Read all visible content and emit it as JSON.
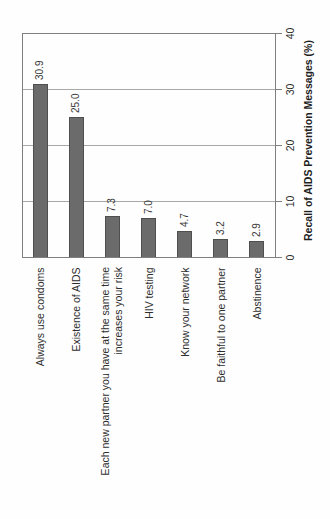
{
  "chart_data": {
    "type": "bar",
    "orientation": "rotated-90-counterclockwise",
    "title": "",
    "axis_label": "Recall of AIDS Prevention Messages (%)",
    "categories": [
      [
        "Always use condoms"
      ],
      [
        "Existence of AIDS"
      ],
      [
        "Each new partner you have at the same time",
        "increases your risk"
      ],
      [
        "HIV testing"
      ],
      [
        "Know your network"
      ],
      [
        "Be faithful to one partner"
      ],
      [
        "Abstinence"
      ]
    ],
    "values": [
      30.9,
      25.0,
      7.3,
      7.0,
      4.7,
      3.2,
      2.9
    ],
    "value_labels": [
      "30.9",
      "25.0",
      "7.3",
      "7.0",
      "4.7",
      "3.2",
      "2.9"
    ],
    "axis_ticks": [
      0,
      10,
      20,
      30,
      40
    ],
    "axis_range": [
      0,
      40
    ],
    "gridline_values": [
      10,
      20,
      30
    ],
    "grid_on": true,
    "legend": "none",
    "bar_color": "#6b6b6b",
    "bar_border_color": "#4f4f4f",
    "grid_color": "#a8a8a8",
    "axis_color": "#7f7f7f",
    "text_color": "#2e2e2e"
  }
}
